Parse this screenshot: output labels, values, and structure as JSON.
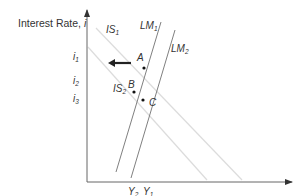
{
  "diagram": {
    "y_axis_label": "Interest Rate, ",
    "y_axis_var": "i",
    "x_axis_label": "Income, Output, ",
    "x_axis_var": "Y",
    "curves": {
      "IS1": {
        "name": "IS",
        "sub": "1"
      },
      "IS2": {
        "name": "IS",
        "sub": "2"
      },
      "LM1": {
        "name": "LM",
        "sub": "1"
      },
      "LM2": {
        "name": "LM",
        "sub": "2"
      }
    },
    "points": {
      "A": "A",
      "B": "B",
      "C": "C"
    },
    "y_ticks": [
      {
        "name": "i",
        "sub": "1"
      },
      {
        "name": "i",
        "sub": "2"
      },
      {
        "name": "i",
        "sub": "3"
      }
    ],
    "x_ticks": [
      {
        "name": "Y",
        "sub": "2"
      },
      {
        "name": "Y",
        "sub": "1"
      }
    ],
    "colors": {
      "axis": "#555555",
      "lm": "#777777",
      "is": "#dddddd",
      "text": "#333333",
      "arrow": "#222222"
    }
  }
}
